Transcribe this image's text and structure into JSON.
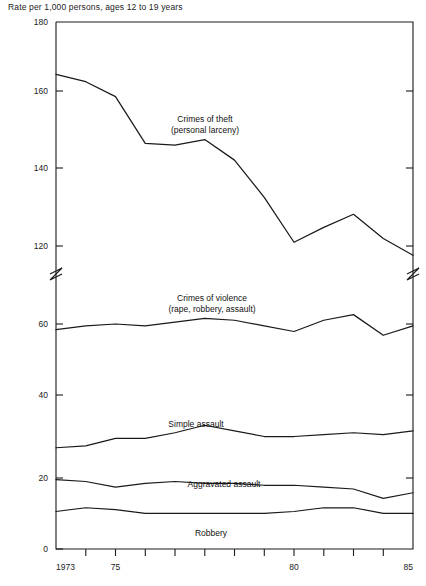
{
  "chart_data": {
    "type": "line",
    "title": "",
    "ylabel": "Rate per 1,000 persons, ages 12 to 19 years",
    "xlabel": "",
    "ylim": [
      0,
      180
    ],
    "y_ticks": [
      0,
      20,
      40,
      60,
      120,
      140,
      160,
      180
    ],
    "y_tick_labels": [
      "0",
      "20",
      "40",
      "60",
      "120",
      "140",
      "160",
      "180"
    ],
    "axis_break": {
      "between": [
        60,
        120
      ],
      "note": "broken y-axis"
    },
    "grid": false,
    "legend": "inline-labels",
    "x": [
      1973,
      1974,
      1975,
      1976,
      1977,
      1978,
      1979,
      1980,
      1981,
      1982,
      1983,
      1984,
      1985
    ],
    "x_tick_labels": [
      "1973",
      "",
      "75",
      "",
      "",
      "",
      "",
      "80",
      "",
      "",
      "",
      "",
      "85"
    ],
    "series": [
      {
        "name": "Crimes of theft (personal larceny)",
        "label_line1": "Crimes of theft",
        "label_line2": "(personal larceny)",
        "values": [
          166,
          164,
          160,
          147.5,
          147,
          148.5,
          143,
          133,
          121,
          125,
          128.5,
          122,
          117.5
        ]
      },
      {
        "name": "Crimes of violence (rape, robbery, assault)",
        "label_line1": "Crimes of violence",
        "label_line2": "(rape, robbery, assault)",
        "values": [
          58.5,
          59.5,
          60,
          59.5,
          60.5,
          61.5,
          61,
          59.5,
          58,
          61,
          62.5,
          57,
          59.5
        ]
      },
      {
        "name": "Simple assault",
        "label_line1": "Simple assault",
        "label_line2": "",
        "values": [
          27,
          27.5,
          29.5,
          29.5,
          31,
          33,
          31.5,
          30,
          30,
          30.5,
          31,
          30.5,
          31.5
        ]
      },
      {
        "name": "Aggravated assault",
        "label_line1": "Aggravated assault",
        "label_line2": "",
        "values": [
          18.5,
          18,
          16.5,
          17.5,
          18,
          17.5,
          17.5,
          17,
          17,
          16.5,
          16,
          13.5,
          15
        ]
      },
      {
        "name": "Robbery",
        "label_line1": "Robbery",
        "label_line2": "",
        "values": [
          10,
          11,
          10.5,
          9.5,
          9.5,
          9.5,
          9.5,
          9.5,
          10,
          11,
          11,
          9.5,
          9.5
        ]
      }
    ],
    "colors": {
      "line": "#1a1a1a",
      "text": "#222222",
      "background": "#ffffff"
    }
  },
  "axis": {
    "y_title": "Rate per 1,000 persons, ages 12 to 19 years",
    "y_labels": {
      "t180": "180",
      "t160": "160",
      "t140": "140",
      "t120": "120",
      "t60": "60",
      "t40": "40",
      "t20": "20",
      "t0": "0"
    },
    "x_labels": {
      "start": "1973",
      "mid75": "75",
      "mid80": "80",
      "end": "85"
    }
  },
  "series_labels": {
    "theft_1": "Crimes of theft",
    "theft_2": "(personal larceny)",
    "violence_1": "Crimes of violence",
    "violence_2": "(rape, robbery, assault)",
    "simple": "Simple assault",
    "aggravated": "Aggravated assault",
    "robbery": "Robbery"
  }
}
